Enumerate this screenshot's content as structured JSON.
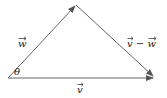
{
  "diagram": {
    "type": "vector-triangle",
    "stroke_color": "#555555",
    "labels": {
      "w": "w",
      "v": "v",
      "v_minus_w": "v − w",
      "theta": "θ"
    },
    "vertices": {
      "origin": [
        8,
        78
      ],
      "apex": [
        76,
        5
      ],
      "end": [
        155,
        78
      ]
    }
  }
}
